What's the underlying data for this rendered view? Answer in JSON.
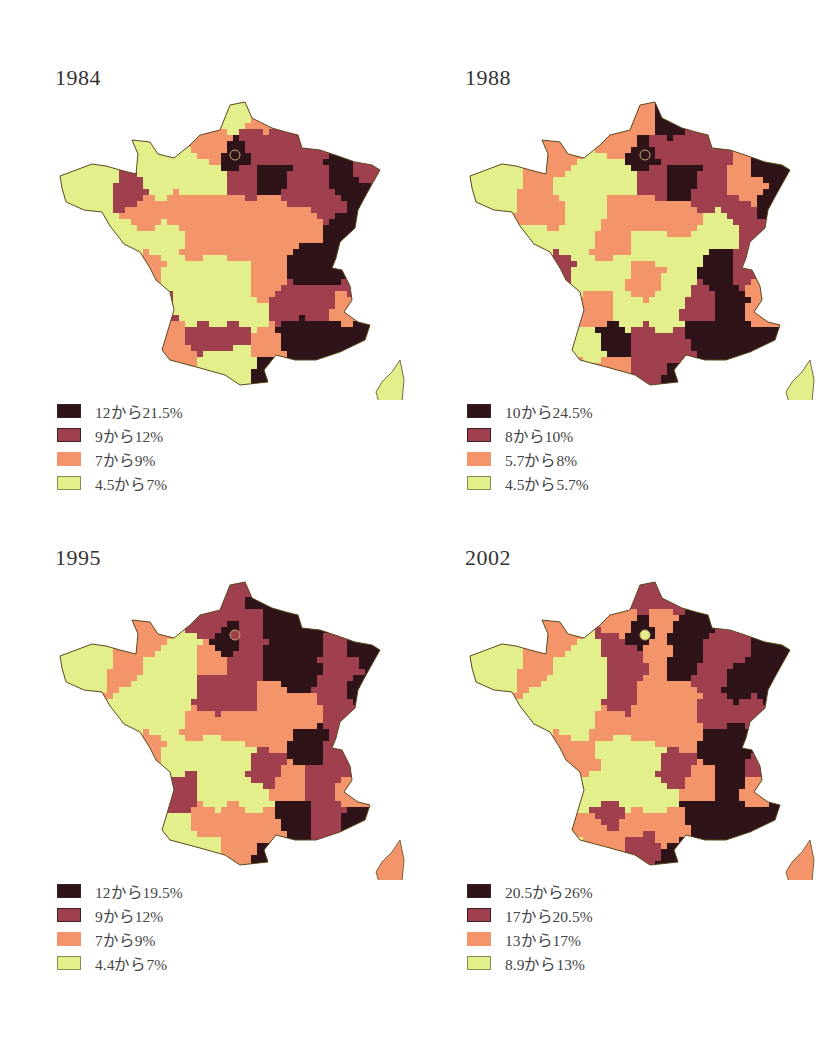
{
  "colors": {
    "c1": "#2e1418",
    "c2": "#a0404f",
    "c3": "#f4946a",
    "c4": "#e3ef8a",
    "border": "#5a4a20"
  },
  "panels": [
    {
      "year": "1984",
      "legend": [
        "12から21.5%",
        "9から12%",
        "7から9%",
        "4.5から7%"
      ]
    },
    {
      "year": "1988",
      "legend": [
        "10から24.5%",
        "8から10%",
        "5.7から8%",
        "4.5から5.7%"
      ]
    },
    {
      "year": "1995",
      "legend": [
        "12から19.5%",
        "9から12%",
        "7から9%",
        "4.4から7%"
      ]
    },
    {
      "year": "2002",
      "legend": [
        "20.5から26%",
        "17から20.5%",
        "13から17%",
        "8.9から13%"
      ]
    }
  ],
  "chart_data": [
    {
      "type": "heatmap",
      "title": "1984",
      "map": "France by département (choropleth)",
      "legend": [
        {
          "label": "12から21.5%",
          "range": [
            12,
            21.5
          ],
          "color": "#2e1418"
        },
        {
          "label": "9から12%",
          "range": [
            9,
            12
          ],
          "color": "#a0404f"
        },
        {
          "label": "7から9%",
          "range": [
            7,
            9
          ],
          "color": "#f4946a"
        },
        {
          "label": "4.5から7%",
          "range": [
            4.5,
            7
          ],
          "color": "#e3ef8a"
        }
      ],
      "regions_summary": {
        "highest": [
          "Paris region",
          "north-east",
          "Rhône-Alpes",
          "Provence/Mediterranean coast",
          "Pyrénées-Orientales"
        ],
        "lowest": [
          "Brittany",
          "Normandy (Manche)",
          "Nord tip",
          "central west",
          "Massif Central",
          "Corsica"
        ]
      }
    },
    {
      "type": "heatmap",
      "title": "1988",
      "map": "France by département (choropleth)",
      "legend": [
        {
          "label": "10から24.5%",
          "range": [
            10,
            24.5
          ],
          "color": "#2e1418"
        },
        {
          "label": "8から10%",
          "range": [
            8,
            10
          ],
          "color": "#a0404f"
        },
        {
          "label": "5.7から8%",
          "range": [
            5.7,
            8
          ],
          "color": "#f4946a"
        },
        {
          "label": "4.5から5.7%",
          "range": [
            4.5,
            5.7
          ],
          "color": "#e3ef8a"
        }
      ],
      "regions_summary": {
        "highest": [
          "Nord",
          "Paris region",
          "Alsace",
          "Rhône valley",
          "Mediterranean coast"
        ],
        "lowest": [
          "Brittany",
          "west",
          "Massif Central",
          "Landes",
          "Corsica"
        ]
      }
    },
    {
      "type": "heatmap",
      "title": "1995",
      "map": "France by département (choropleth)",
      "legend": [
        {
          "label": "12から19.5%",
          "range": [
            12,
            19.5
          ],
          "color": "#2e1418"
        },
        {
          "label": "9から12%",
          "range": [
            9,
            12
          ],
          "color": "#a0404f"
        },
        {
          "label": "7から9%",
          "range": [
            7,
            9
          ],
          "color": "#f4946a"
        },
        {
          "label": "4.4から7%",
          "range": [
            4.4,
            7
          ],
          "color": "#e3ef8a"
        }
      ],
      "regions_summary": {
        "highest": [
          "north-east",
          "Paris basin",
          "Champagne",
          "Lorraine",
          "Alsace",
          "Rhône",
          "Mediterranean coast"
        ],
        "lowest": [
          "Brittany",
          "west",
          "south-west",
          "Massif Central"
        ],
        "corsica": "7から9%"
      }
    },
    {
      "type": "heatmap",
      "title": "2002",
      "map": "France by département (choropleth)",
      "legend": [
        {
          "label": "20.5から26%",
          "range": [
            20.5,
            26
          ],
          "color": "#2e1418"
        },
        {
          "label": "17から20.5%",
          "range": [
            17,
            20.5
          ],
          "color": "#a0404f"
        },
        {
          "label": "13から17%",
          "range": [
            13,
            17
          ],
          "color": "#f4946a"
        },
        {
          "label": "8.9から13%",
          "range": [
            8.9,
            13
          ],
          "color": "#e3ef8a"
        }
      ],
      "regions_summary": {
        "highest": [
          "north-east",
          "Lorraine",
          "Alsace",
          "Rhône-Alpes",
          "Mediterranean coast",
          "Pyrénées-Orientales"
        ],
        "lowest": [
          "Brittany",
          "west",
          "south-west (Landes)",
          "Massif Central"
        ],
        "paris_city": "8.9から13%",
        "corsica": "13から17%"
      }
    }
  ]
}
